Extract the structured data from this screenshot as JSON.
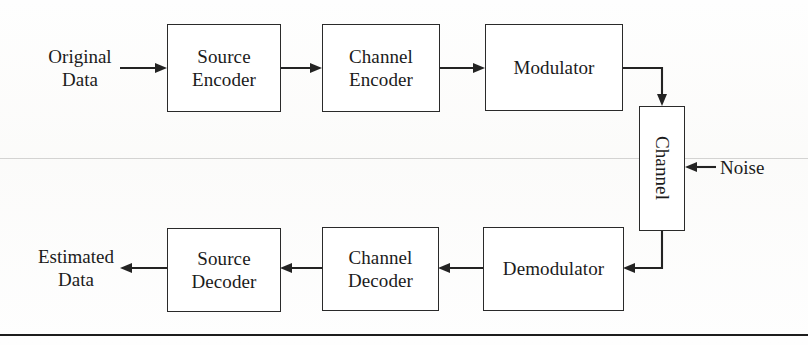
{
  "figure": {
    "type": "block-diagram",
    "title_text": "",
    "background_color": "#ffffff",
    "line_color": "#232323",
    "text_color": "#1b1b1b"
  },
  "labels": {
    "original_data": "Original\nData",
    "estimated_data": "Estimated\nData",
    "noise": "Noise"
  },
  "blocks": {
    "source_encoder": "Source\nEncoder",
    "channel_encoder": "Channel\nEncoder",
    "modulator": "Modulator",
    "channel": "Channel",
    "demodulator": "Demodulator",
    "channel_decoder": "Channel\nDecoder",
    "source_decoder": "Source\nDecoder"
  },
  "flow": {
    "transmit_chain": [
      "Original Data",
      "Source Encoder",
      "Channel Encoder",
      "Modulator",
      "Channel"
    ],
    "receive_chain": [
      "Channel",
      "Demodulator",
      "Channel Decoder",
      "Source Decoder",
      "Estimated Data"
    ],
    "external_inputs": [
      "Noise"
    ]
  }
}
